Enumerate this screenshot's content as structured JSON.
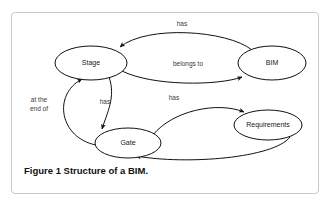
{
  "figure": {
    "caption_label": "Figure 1",
    "caption_text": "Structure of a BIM.",
    "border_color": "#c9c9c9",
    "background_color": "#ffffff",
    "stroke_color": "#111111"
  },
  "diagram": {
    "type": "directed-graph",
    "nodes": [
      {
        "id": "stage",
        "label": "Stage",
        "cx": 79,
        "cy": 50,
        "rx": 36,
        "ry": 17
      },
      {
        "id": "bim",
        "label": "BIM",
        "cx": 260,
        "cy": 50,
        "rx": 34,
        "ry": 17
      },
      {
        "id": "requirements",
        "label": "Requirements",
        "cx": 256,
        "cy": 112,
        "rx": 34,
        "ry": 15
      },
      {
        "id": "gate",
        "label": "Gate",
        "cx": 116,
        "cy": 130,
        "rx": 33,
        "ry": 15
      }
    ],
    "edges": [
      {
        "id": "bim-has-stage",
        "label": "has",
        "from": "bim",
        "to": "stage",
        "lx": 170,
        "ly": 11
      },
      {
        "id": "stage-belongsto-bim",
        "label": "belongs to",
        "from": "stage",
        "to": "bim",
        "lx": 176,
        "ly": 51
      },
      {
        "id": "stage-has-gate",
        "label": "has",
        "from": "stage",
        "to": "gate",
        "lx": 93,
        "ly": 89
      },
      {
        "id": "gate-attheendof-stage",
        "label": "at the\nend of",
        "line1": "at the",
        "line2": "end of",
        "from": "gate",
        "to": "stage",
        "lx": 27,
        "ly": 91
      },
      {
        "id": "gate-has-requirements",
        "label": "has",
        "from": "gate",
        "to": "requirements",
        "lx": 162,
        "ly": 85
      },
      {
        "id": "requirements-for-gate",
        "label": "for",
        "from": "requirements",
        "to": "gate",
        "lx": 175,
        "ly": 156
      }
    ]
  }
}
